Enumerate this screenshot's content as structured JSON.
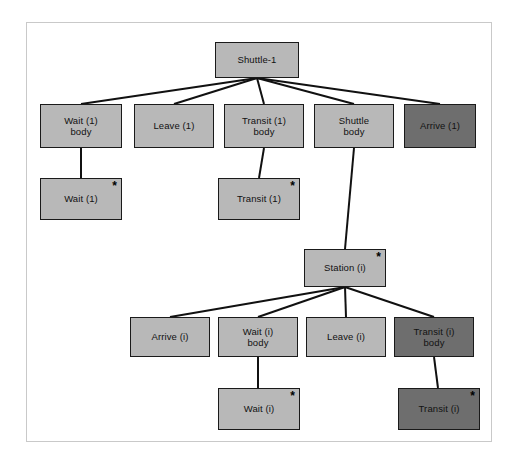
{
  "diagram": {
    "frame": {
      "stroke": "#c9c9c9",
      "fill": "#ffffff"
    },
    "colors": {
      "light_node": "#b8b8b8",
      "dark_node": "#6e6e6e",
      "node_border": "#1a1a1a",
      "edge": "#111111",
      "background": "#ffffff"
    },
    "star_glyph": "*",
    "nodes": [
      {
        "id": "shuttle-1",
        "label": "Shuttle-1",
        "shade": "light",
        "star": false,
        "x": 215,
        "y": 42,
        "w": 84,
        "h": 36
      },
      {
        "id": "wait-1-body",
        "label": "Wait (1)\nbody",
        "shade": "light",
        "star": false,
        "x": 40,
        "y": 104,
        "w": 82,
        "h": 44
      },
      {
        "id": "leave-1",
        "label": "Leave (1)",
        "shade": "light",
        "star": false,
        "x": 134,
        "y": 104,
        "w": 80,
        "h": 44
      },
      {
        "id": "transit-1-body",
        "label": "Transit (1)\nbody",
        "shade": "light",
        "star": false,
        "x": 224,
        "y": 104,
        "w": 80,
        "h": 44
      },
      {
        "id": "shuttle-body",
        "label": "Shuttle\nbody",
        "shade": "light",
        "star": false,
        "x": 314,
        "y": 104,
        "w": 80,
        "h": 44
      },
      {
        "id": "arrive-1",
        "label": "Arrive (1)",
        "shade": "dark",
        "star": false,
        "x": 404,
        "y": 104,
        "w": 72,
        "h": 44
      },
      {
        "id": "wait-1",
        "label": "Wait (1)",
        "shade": "light",
        "star": true,
        "x": 40,
        "y": 178,
        "w": 82,
        "h": 42
      },
      {
        "id": "transit-1",
        "label": "Transit (1)",
        "shade": "light",
        "star": true,
        "x": 218,
        "y": 178,
        "w": 82,
        "h": 42
      },
      {
        "id": "station-i",
        "label": "Station (i)",
        "shade": "light",
        "star": true,
        "x": 304,
        "y": 249,
        "w": 82,
        "h": 38
      },
      {
        "id": "arrive-i",
        "label": "Arrive (i)",
        "shade": "light",
        "star": false,
        "x": 130,
        "y": 317,
        "w": 80,
        "h": 40
      },
      {
        "id": "wait-i-body",
        "label": "Wait (i)\nbody",
        "shade": "light",
        "star": false,
        "x": 218,
        "y": 317,
        "w": 80,
        "h": 40
      },
      {
        "id": "leave-i",
        "label": "Leave (i)",
        "shade": "light",
        "star": false,
        "x": 306,
        "y": 317,
        "w": 80,
        "h": 40
      },
      {
        "id": "transit-i-body",
        "label": "Transit (i)\nbody",
        "shade": "dark",
        "star": false,
        "x": 394,
        "y": 317,
        "w": 80,
        "h": 40
      },
      {
        "id": "wait-i",
        "label": "Wait (i)",
        "shade": "light",
        "star": true,
        "x": 218,
        "y": 388,
        "w": 82,
        "h": 42
      },
      {
        "id": "transit-i",
        "label": "Transit (i)",
        "shade": "dark",
        "star": true,
        "x": 398,
        "y": 388,
        "w": 82,
        "h": 42
      }
    ],
    "edges": [
      {
        "from": "shuttle-1",
        "to": "wait-1-body",
        "x1": 257,
        "y1": 78,
        "x2": 81,
        "y2": 104
      },
      {
        "from": "shuttle-1",
        "to": "leave-1",
        "x1": 257,
        "y1": 78,
        "x2": 174,
        "y2": 104
      },
      {
        "from": "shuttle-1",
        "to": "transit-1-body",
        "x1": 257,
        "y1": 78,
        "x2": 264,
        "y2": 104
      },
      {
        "from": "shuttle-1",
        "to": "shuttle-body",
        "x1": 257,
        "y1": 78,
        "x2": 354,
        "y2": 104
      },
      {
        "from": "shuttle-1",
        "to": "arrive-1",
        "x1": 257,
        "y1": 78,
        "x2": 440,
        "y2": 104
      },
      {
        "from": "wait-1-body",
        "to": "wait-1",
        "x1": 81,
        "y1": 148,
        "x2": 81,
        "y2": 178
      },
      {
        "from": "transit-1-body",
        "to": "transit-1",
        "x1": 264,
        "y1": 148,
        "x2": 259,
        "y2": 178
      },
      {
        "from": "shuttle-body",
        "to": "station-i",
        "x1": 354,
        "y1": 148,
        "x2": 345,
        "y2": 249
      },
      {
        "from": "station-i",
        "to": "arrive-i",
        "x1": 345,
        "y1": 287,
        "x2": 170,
        "y2": 317
      },
      {
        "from": "station-i",
        "to": "wait-i-body",
        "x1": 345,
        "y1": 287,
        "x2": 258,
        "y2": 317
      },
      {
        "from": "station-i",
        "to": "leave-i",
        "x1": 345,
        "y1": 287,
        "x2": 346,
        "y2": 317
      },
      {
        "from": "station-i",
        "to": "transit-i-body",
        "x1": 345,
        "y1": 287,
        "x2": 434,
        "y2": 317
      },
      {
        "from": "wait-i-body",
        "to": "wait-i",
        "x1": 258,
        "y1": 357,
        "x2": 258,
        "y2": 388
      },
      {
        "from": "transit-i-body",
        "to": "transit-i",
        "x1": 434,
        "y1": 357,
        "x2": 438,
        "y2": 388
      }
    ]
  }
}
